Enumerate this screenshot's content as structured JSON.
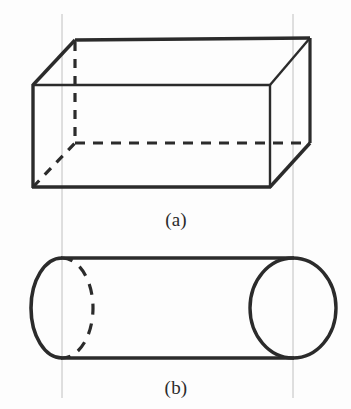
{
  "figure": {
    "background_color": "#fdfdfd",
    "stroke_color": "#2b2b2b",
    "guide_color": "#b9b9b9",
    "panels": [
      {
        "id": "panel-a",
        "caption": "(a)",
        "shape_name": "rectangular-prism",
        "caption_x": 176,
        "caption_y": 226
      },
      {
        "id": "panel-b",
        "caption": "(b)",
        "shape_name": "cylinder",
        "caption_x": 176,
        "caption_y": 394
      }
    ],
    "guide_lines": [
      {
        "name": "left-guide-line",
        "x": 62,
        "y1": 14,
        "y2": 398
      },
      {
        "name": "right-guide-line",
        "x": 293,
        "y1": 14,
        "y2": 398
      }
    ],
    "prism": {
      "front_face": {
        "left": 33,
        "right": 270,
        "top": 85,
        "bottom": 187
      },
      "back_face": {
        "left": 75,
        "right": 310,
        "top": 40,
        "bottom": 143
      },
      "hidden_edges": [
        "back-vertical-left",
        "back-horizontal-bottom"
      ]
    },
    "cylinder": {
      "axis_y": 308,
      "body_top_y": 258,
      "body_bottom_y": 358,
      "left_cap_center_x": 62,
      "right_cap_center_x": 293,
      "cap_rx": 31,
      "cap_ry": 50,
      "left_outline_x": 31,
      "right_outline_x": 336,
      "hidden_arc": "left-cap-back-half"
    },
    "stroke_widths": {
      "solid_main": 3.4,
      "solid_thin": 2.2,
      "dashed": 3.2,
      "guide": 0.9
    }
  }
}
